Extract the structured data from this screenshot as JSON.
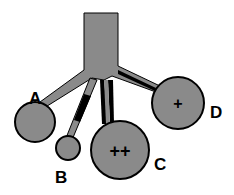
{
  "diagram": {
    "type": "branching-structure",
    "colors": {
      "fill": "#8a8a8a",
      "stroke": "#000000",
      "background": "#ffffff"
    },
    "branches": [
      {
        "id": "A",
        "label": "A",
        "sign": ""
      },
      {
        "id": "B",
        "label": "B",
        "sign": ""
      },
      {
        "id": "C",
        "label": "C",
        "sign": "++"
      },
      {
        "id": "D",
        "label": "D",
        "sign": "+"
      }
    ]
  }
}
